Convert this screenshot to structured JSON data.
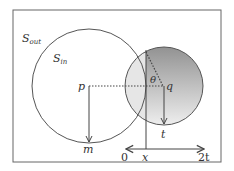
{
  "diagram": {
    "labels": {
      "s_out": "S",
      "s_out_sub": "out",
      "s_in": "S",
      "s_in_sub": "in",
      "p": "p",
      "q": "q",
      "theta": "θ",
      "t": "t",
      "m": "m",
      "axis_start": "0",
      "axis_x": "x",
      "axis_end": "2t"
    },
    "colors": {
      "stroke": "#555555",
      "frame": "#666666",
      "light_fill": "#e6e6e6",
      "gradient_top": "#8a8a8a",
      "gradient_bottom": "#f2f2f2"
    }
  }
}
